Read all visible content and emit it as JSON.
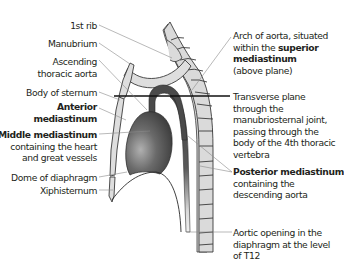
{
  "left_labels": [
    {
      "id": "first-rib",
      "lines": [
        "1st rib"
      ]
    },
    {
      "id": "manubrium",
      "lines": [
        "Manubrium"
      ]
    },
    {
      "id": "ascending-aorta",
      "lines": [
        "Ascending",
        "thoracic aorta"
      ]
    },
    {
      "id": "body-of-sternum",
      "lines": [
        "Body of sternum"
      ]
    },
    {
      "id": "anterior-mediastinum",
      "lines": [
        "Anterior",
        "mediastinum"
      ],
      "bold": true
    },
    {
      "id": "middle-mediastinum",
      "bold_line": "Middle mediastinum",
      "lines": [
        "containing the heart",
        "and great vessels"
      ]
    },
    {
      "id": "dome-of-diaphragm",
      "lines": [
        "Dome of diaphragm"
      ]
    },
    {
      "id": "xiphisternum",
      "lines": [
        "Xiphisternum"
      ]
    }
  ],
  "right_labels": {
    "arch": {
      "line1": "Arch of aorta, situated",
      "line2_prefix": "within the ",
      "line2_bold": "superior",
      "line3_bold": "mediastinum",
      "line4": "(above plane)"
    },
    "plane": {
      "lines": [
        "Transverse plane",
        "through the",
        "manubriosternal joint,",
        "passing through the",
        "body of the 4th thoracic",
        "vertebra"
      ]
    },
    "posterior": {
      "bold_line": "Posterior mediastinum",
      "lines": [
        "containing the",
        "descending aorta"
      ]
    },
    "aortic_opening": {
      "lines": [
        "Aortic opening in the",
        "diaphragm at the level",
        "of T12"
      ]
    }
  },
  "colors": {
    "text": "#231f20",
    "bone_fill": "#d9d9d9",
    "bone_stroke": "#3a3a3a",
    "aorta": "#4a4a4a",
    "heart_dark": "#3c3c3c",
    "heart_light": "#9a9a9a",
    "leader": "#8a8a8a",
    "plane": "#111111"
  }
}
